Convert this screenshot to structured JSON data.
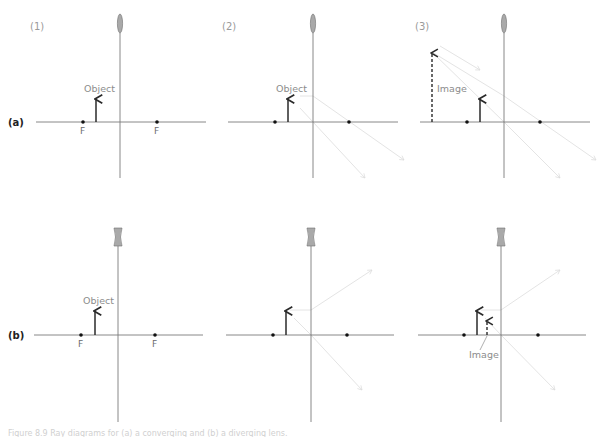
{
  "figure": {
    "panel_labels": [
      "(1)",
      "(2)",
      "(3)"
    ],
    "row_labels": [
      "(a)",
      "(b)"
    ],
    "focal_label": "F",
    "object_label": "Object",
    "image_label": "Image",
    "colors": {
      "axis": "#7a7a7a",
      "arrow": "#2a2a2a",
      "ray": "#e4e4e4",
      "lens_fill": "#a9a9a9",
      "lens_stroke": "#6f6f6f",
      "dot": "#111111"
    }
  },
  "rows": [
    {
      "id": "a",
      "label": "(a)",
      "lens_type": "convex",
      "axis_y": 122,
      "panels": [
        {
          "id": "a1",
          "panel_label": "(1)",
          "lens_x": 120,
          "axis_x0": 36,
          "axis_x1": 206,
          "f_left": 83,
          "f_right": 157,
          "obj_x": 96,
          "obj_top": 98,
          "show_f_labels": true,
          "show_object_label": true,
          "rays": [],
          "image": null
        },
        {
          "id": "a2",
          "panel_label": "(2)",
          "lens_x": 313,
          "axis_x0": 228,
          "axis_x1": 398,
          "f_left": 275,
          "f_right": 349,
          "obj_x": 288,
          "obj_top": 98,
          "show_f_labels": false,
          "show_object_label": true,
          "rays": [
            [
              300,
              96,
              313,
              96,
              404,
              160
            ],
            [
              300,
              108,
              313,
              122,
              365,
              178
            ]
          ],
          "image": null
        },
        {
          "id": "a3",
          "panel_label": "(3)",
          "lens_x": 504,
          "axis_x0": 420,
          "axis_x1": 590,
          "f_left": 467,
          "f_right": 540,
          "obj_x": 480,
          "obj_top": 98,
          "show_f_labels": false,
          "show_object_label": false,
          "rays": [
            [
              432,
              52,
              504,
              96,
              596,
              160
            ],
            [
              432,
              52,
              504,
              122,
              560,
              178
            ],
            [
              440,
              46,
              480,
              70
            ]
          ],
          "image": {
            "x": 432,
            "top": 52,
            "bottom": 122,
            "label_x": 437,
            "label_y": 92,
            "leader": null
          }
        }
      ]
    },
    {
      "id": "b",
      "label": "(b)",
      "lens_type": "concave",
      "axis_y": 335,
      "panels": [
        {
          "id": "b1",
          "panel_label": "",
          "lens_x": 118,
          "axis_x0": 34,
          "axis_x1": 203,
          "f_left": 81,
          "f_right": 155,
          "obj_x": 95,
          "obj_top": 310,
          "show_f_labels": true,
          "show_object_label": true,
          "rays": [],
          "image": null
        },
        {
          "id": "b2",
          "panel_label": "",
          "lens_x": 311,
          "axis_x0": 226,
          "axis_x1": 394,
          "f_left": 273,
          "f_right": 347,
          "obj_x": 286,
          "obj_top": 310,
          "show_f_labels": false,
          "show_object_label": false,
          "rays": [
            [
              290,
              310,
              311,
              310,
              372,
              270
            ],
            [
              294,
              318,
              311,
              335,
              362,
              390
            ]
          ],
          "image": null
        },
        {
          "id": "b3",
          "panel_label": "",
          "lens_x": 501,
          "axis_x0": 418,
          "axis_x1": 586,
          "f_left": 464,
          "f_right": 538,
          "obj_x": 477,
          "obj_top": 310,
          "show_f_labels": false,
          "show_object_label": false,
          "rays": [
            [
              481,
              310,
              501,
              310,
              560,
              270
            ],
            [
              485,
              318,
              501,
              335,
              555,
              390
            ]
          ],
          "image": {
            "x": 487,
            "top": 320,
            "bottom": 335,
            "label_x": 469,
            "label_y": 358,
            "leader": [
              480,
              350,
              487,
              336
            ]
          }
        }
      ]
    }
  ],
  "caption": "Figure 8.9  Ray diagrams for (a) a converging and (b) a diverging lens."
}
